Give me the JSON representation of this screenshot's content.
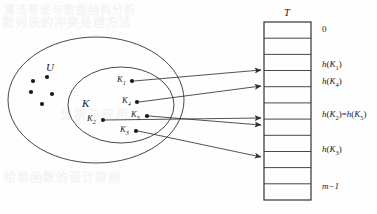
{
  "figure": {
    "caption_title": "Hash table mapping of keys to slots",
    "universe_label": "U",
    "keyset_label": "K",
    "table_label": "T"
  },
  "colors": {
    "stroke": "#333333",
    "text": "#1a1a1a",
    "background": "#fefefe",
    "bleed": "#f4f4f4"
  },
  "universe": {
    "label": "U",
    "unlabeled_keys_count": 5,
    "unlabeled_keys": [
      {
        "x": 33,
        "y": 81
      },
      {
        "x": 47,
        "y": 77
      },
      {
        "x": 31,
        "y": 92
      },
      {
        "x": 52,
        "y": 94
      },
      {
        "x": 42,
        "y": 104
      }
    ]
  },
  "keyset": {
    "label": "K",
    "keys": [
      {
        "id": "K1",
        "label": "K",
        "sub": "1",
        "dot_x": 132,
        "dot_y": 81,
        "label_x": 117,
        "label_y": 77
      },
      {
        "id": "K4",
        "label": "K",
        "sub": "4",
        "dot_x": 137,
        "dot_y": 102,
        "label_x": 122,
        "label_y": 98
      },
      {
        "id": "K5",
        "label": "K",
        "sub": "5",
        "dot_x": 147,
        "dot_y": 116,
        "label_x": 131,
        "label_y": 112
      },
      {
        "id": "K2",
        "label": "K",
        "sub": "2",
        "dot_x": 103,
        "dot_y": 120,
        "label_x": 87,
        "label_y": 116
      },
      {
        "id": "K3",
        "label": "K",
        "sub": "3",
        "dot_x": 136,
        "dot_y": 131,
        "label_x": 120,
        "label_y": 127
      }
    ]
  },
  "table": {
    "label": "T",
    "slot_count": 11,
    "x": 264,
    "y": 22,
    "width": 47,
    "height": 178,
    "slot_labels": [
      {
        "index": 0,
        "text": "0",
        "type": "plain"
      },
      {
        "index": 3,
        "text": "h(K1)",
        "type": "hash",
        "fn": "h",
        "key": "K",
        "sub": "1"
      },
      {
        "index": 4,
        "text": "h(K4)",
        "type": "hash",
        "fn": "h",
        "key": "K",
        "sub": "4"
      },
      {
        "index": 6,
        "text": "h(K2)=h(K5)",
        "type": "hash-collision",
        "fn": "h",
        "key": "K",
        "sub_a": "2",
        "sub_b": "5"
      },
      {
        "index": 8,
        "text": "h(K3)",
        "type": "hash",
        "fn": "h",
        "key": "K",
        "sub": "3"
      },
      {
        "index": 10,
        "text": "m-1",
        "type": "plain-italic"
      }
    ]
  },
  "mappings": [
    {
      "from": "K1",
      "to_slot": 3,
      "collision": false
    },
    {
      "from": "K4",
      "to_slot": 4,
      "collision": false
    },
    {
      "from": "K2",
      "to_slot": 6,
      "collision": true
    },
    {
      "from": "K5",
      "to_slot": 6,
      "collision": true
    },
    {
      "from": "K3",
      "to_slot": 8,
      "collision": false
    }
  ],
  "bleed_text": {
    "line1": "算法导论与数据结构分析",
    "line2": "散列表的冲突处理方法",
    "line3": "分析与应用",
    "line4": "哈希函数的设计原则"
  }
}
